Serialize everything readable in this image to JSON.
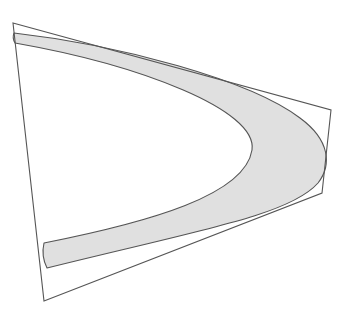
{
  "diagram": {
    "background": "#ffffff",
    "stroke_color": "#555555",
    "band_fill": "#e0e0e0",
    "quadrilateral": {
      "points": [
        [
          13,
          23
        ],
        [
          331,
          110
        ],
        [
          322,
          193
        ],
        [
          44,
          301
        ]
      ]
    },
    "band": {
      "outer_path": "M 14 33 C 120 45, 250 80, 300 118 C 330 140, 332 165, 318 183 C 290 215, 200 230, 47 268",
      "inner_path": "M 44 243 C 150 222, 245 195, 252 150 C 258 110, 140 65, 15 43",
      "path": "M 14 33 C 120 45, 250 80, 300 118 C 330 140, 332 165, 318 183 C 290 215, 200 230, 47 268 Q 41 256 44 243 C 150 222, 245 195, 252 150 C 258 110, 140 65, 15 43 Q 12 38 14 33 Z"
    }
  }
}
